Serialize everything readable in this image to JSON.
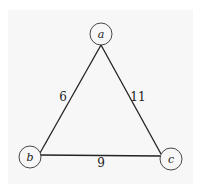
{
  "graph": {
    "nodes": [
      {
        "id": "a",
        "label": "a",
        "x": 101,
        "y": 34
      },
      {
        "id": "b",
        "label": "b",
        "x": 30,
        "y": 157
      },
      {
        "id": "c",
        "label": "c",
        "x": 171,
        "y": 159
      }
    ],
    "edges": [
      {
        "from": "a",
        "to": "b",
        "weight": "6"
      },
      {
        "from": "a",
        "to": "c",
        "weight": "11"
      },
      {
        "from": "b",
        "to": "c",
        "weight": "9"
      }
    ]
  },
  "colors": {
    "background": "#f7f7f7",
    "stroke": "#222222"
  }
}
